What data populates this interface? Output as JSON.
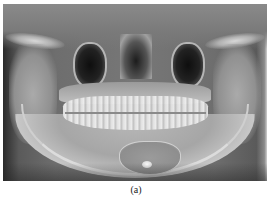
{
  "figure": {
    "type": "panoramic dental radiograph",
    "caption": "(a)"
  }
}
